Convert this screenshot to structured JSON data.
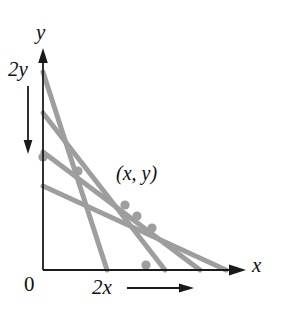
{
  "figure": {
    "title_labels": {
      "y_axis": "y",
      "x_axis": "x",
      "two_y": "2y",
      "two_x": "2x",
      "origin": "0",
      "point": "(x, y)"
    },
    "colors": {
      "axis": "#1a1a1a",
      "line": "#9e9e9e",
      "dot": "#9e9e9e",
      "background": "#ffffff"
    }
  },
  "chart_data": {
    "type": "line",
    "title": "",
    "xlabel": "x",
    "ylabel": "y",
    "grid": false,
    "legend": "none",
    "axes": {
      "x_origin_px": 43,
      "y_origin_px": 270,
      "x_axis_end_px": 242,
      "y_axis_end_px": 52
    },
    "annotations": [
      {
        "text": "2y",
        "role": "y-intercept-parameter",
        "arrow": "down"
      },
      {
        "text": "2x",
        "role": "x-intercept-parameter",
        "arrow": "right"
      },
      {
        "text": "(x, y)",
        "role": "common-point-label"
      },
      {
        "text": "0",
        "role": "origin-label"
      }
    ],
    "series": [
      {
        "name": "line-1",
        "x": [
          43,
          107
        ],
        "y": [
          72,
          270
        ],
        "y_intercept_px": 72,
        "x_intercept_px": 107
      },
      {
        "name": "line-2",
        "x": [
          43,
          165
        ],
        "y": [
          113,
          270
        ],
        "y_intercept_px": 113,
        "x_intercept_px": 165
      },
      {
        "name": "line-3",
        "x": [
          43,
          200
        ],
        "y": [
          152,
          270
        ],
        "y_intercept_px": 152,
        "x_intercept_px": 200
      },
      {
        "name": "line-4",
        "x": [
          43,
          226
        ],
        "y": [
          186,
          270
        ],
        "y_intercept_px": 186,
        "x_intercept_px": 226
      }
    ],
    "points": [
      {
        "name": "dot-y-axis",
        "x": 43,
        "y": 157
      },
      {
        "name": "dot-upper",
        "x": 78,
        "y": 171
      },
      {
        "name": "dot-mid-1",
        "x": 125,
        "y": 205
      },
      {
        "name": "dot-mid-2",
        "x": 137,
        "y": 216
      },
      {
        "name": "dot-mid-3",
        "x": 152,
        "y": 228
      },
      {
        "name": "dot-x-axis",
        "x": 146,
        "y": 265
      }
    ]
  }
}
